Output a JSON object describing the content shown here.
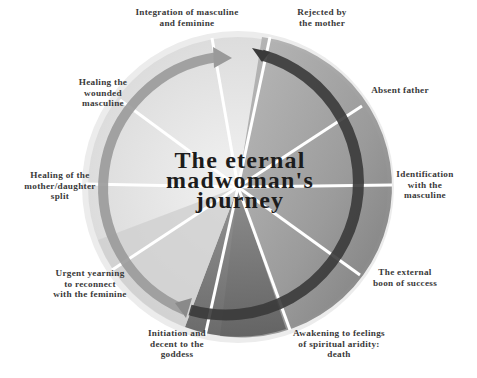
{
  "diagram": {
    "title": "The eternal\nmadwoman's\njourney",
    "colors": {
      "background": "#ffffff",
      "light_wash": "#e6e6e6",
      "mid_wash": "#a8a8a8",
      "dark_wash": "#6e6e6e",
      "dark_arrow": "#3a3a3a",
      "light_arrow": "#9a9a9a",
      "divider": "#ffffff",
      "label_text": "#3a3a3a",
      "title_text": "#1c1c1c"
    },
    "stages": [
      {
        "id": "rejected-by-mother",
        "label": "Rejected by\nthe mother"
      },
      {
        "id": "absent-father",
        "label": "Absent father"
      },
      {
        "id": "identification-masculine",
        "label": "Identification\nwith the\nmasculine"
      },
      {
        "id": "external-boon",
        "label": "The external\nboon of success"
      },
      {
        "id": "spiritual-aridity",
        "label": "Awakening to feelings\nof spiritual aridity:\ndeath"
      },
      {
        "id": "initiation-descent",
        "label": "Initiation and\ndecent to the\ngoddess"
      },
      {
        "id": "urgent-yearning",
        "label": "Urgent yearning\nto reconnect\nwith the feminine"
      },
      {
        "id": "healing-mother-daughter",
        "label": "Healing of the\nmother/daughter\nsplit"
      },
      {
        "id": "healing-wounded-masculine",
        "label": "Healing the\nwounded\nmasculine"
      },
      {
        "id": "integration",
        "label": "Integration of masculine\nand feminine"
      }
    ],
    "arrows": [
      {
        "id": "descent-arrow",
        "description": "dark arrow clockwise from top to bottom-left"
      },
      {
        "id": "ascent-arrow",
        "description": "light arrow clockwise from bottom-left to top"
      }
    ]
  }
}
